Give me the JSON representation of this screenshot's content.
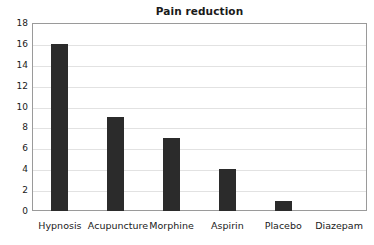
{
  "chart_data": {
    "type": "bar",
    "title": "Pain reduction",
    "subtitle": "",
    "xlabel": "",
    "ylabel": "",
    "categories": [
      "Hypnosis",
      "Acupuncture",
      "Morphine",
      "Aspirin",
      "Placebo",
      "Diazepam"
    ],
    "values": [
      16,
      9,
      7,
      4,
      1,
      0
    ],
    "ylim": [
      0,
      18
    ],
    "ytick_step": 2,
    "ytick_labels": [
      "18",
      "16",
      "14",
      "12",
      "10",
      "8",
      "6",
      "4",
      "2",
      "0"
    ],
    "ytick_values": [
      18,
      16,
      14,
      12,
      10,
      8,
      6,
      4,
      2,
      0
    ],
    "grid": "horizontal",
    "legend": "none",
    "bar_color": "#2b2b2b",
    "gridline_color": "#e2e2e2",
    "axis_color": "#9a9a9a",
    "background_color": "#ffffff",
    "text_color": "#1a1a1a"
  }
}
